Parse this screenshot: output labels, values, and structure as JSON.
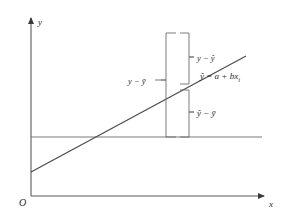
{
  "figure": {
    "type": "regression-deviation-decomposition-diagram",
    "background_color": "#ffffff",
    "line_color": "#555555",
    "text_color": "#2b2b2b"
  },
  "axes": {
    "y_axis_label": "y",
    "x_axis_label": "x",
    "origin_label": "O",
    "y_axis": {
      "x": 31,
      "y_top": 16,
      "y_bottom": 196
    },
    "x_axis": {
      "y": 196,
      "x_left": 31,
      "x_right": 268
    }
  },
  "mean_line": {
    "name": "y-bar-horizontal-line",
    "y": 137,
    "x_start": 31,
    "x_end": 262
  },
  "regression_line": {
    "equation_label": "ŷ = a + bx",
    "equation_subscript": "i",
    "x1": 31,
    "y1": 172,
    "x2": 246,
    "y2": 56
  },
  "brackets": {
    "total": {
      "name": "total-deviation-bracket",
      "label": "y − ȳ",
      "x_left": 166,
      "x_right": 176,
      "y_top": 33,
      "y_bottom": 137,
      "notch_y": 85
    },
    "unexplained": {
      "name": "unexplained-deviation-bracket",
      "label": "y − ŷ",
      "x_left": 180,
      "x_right": 189,
      "y_top": 33,
      "y_bottom": 84,
      "notch_y": 58
    },
    "explained": {
      "name": "explained-deviation-bracket",
      "label": "ŷ − ȳ",
      "x_left": 180,
      "x_right": 189,
      "y_top": 90,
      "y_bottom": 137,
      "notch_y": 113
    }
  },
  "labels": {
    "total_deviation": "y − ȳ",
    "unexplained_deviation": "y − ŷ",
    "explained_deviation": "ŷ − ȳ",
    "regression_equation": "ŷ = a + bx",
    "regression_equation_sub": "i",
    "axis_y": "y",
    "axis_x": "x",
    "origin": "O"
  }
}
